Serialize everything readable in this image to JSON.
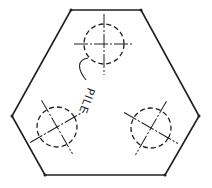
{
  "diagram": {
    "label": "PILE",
    "colors": {
      "stroke": "#222222",
      "background": "#ffffff"
    },
    "outline": {
      "shape": "hexagon",
      "points": [
        [
          71,
          10
        ],
        [
          141,
          10
        ],
        [
          199,
          116
        ],
        [
          165,
          175
        ],
        [
          45,
          175
        ],
        [
          12,
          116
        ]
      ]
    },
    "piles": [
      {
        "name": "top",
        "cx": 104,
        "cy": 44,
        "r": 20
      },
      {
        "name": "left",
        "cx": 57,
        "cy": 127,
        "r": 20
      },
      {
        "name": "right",
        "cx": 151,
        "cy": 128,
        "r": 20
      }
    ]
  }
}
